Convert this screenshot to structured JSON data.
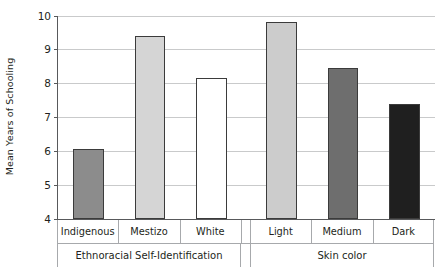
{
  "chart_data": {
    "type": "bar",
    "title": "",
    "subtitle": "",
    "xlabel": "",
    "ylabel": "Mean Years of Schooling",
    "ylim": [
      4,
      10
    ],
    "ytick_labels": [
      "10",
      "9",
      "8",
      "7",
      "6",
      "5",
      "4"
    ],
    "ytick_values": [
      10,
      9,
      8,
      7,
      6,
      5,
      4
    ],
    "grid": true,
    "legend": "none",
    "categories": [
      "Indigenous",
      "Mestizo",
      "White",
      "Light",
      "Medium",
      "Dark"
    ],
    "values": [
      6.05,
      9.4,
      8.15,
      9.8,
      8.45,
      7.4
    ],
    "bar_colors": [
      "#8c8c8c",
      "#d5d5d5",
      "#ffffff",
      "#cccccc",
      "#6e6e6e",
      "#1f1f1f"
    ],
    "bar_border_color": "#3b3b3b",
    "groups": [
      {
        "label": "Ethnoracial Self-Identification",
        "categories": [
          "Indigenous",
          "Mestizo",
          "White"
        ]
      },
      {
        "label": "Skin color",
        "categories": [
          "Light",
          "Medium",
          "Dark"
        ]
      }
    ],
    "series": [
      {
        "name": "Mean Years of Schooling",
        "points": [
          {
            "category": "Indigenous",
            "group": "Ethnoracial Self-Identification",
            "value": 6.05,
            "color": "#8c8c8c"
          },
          {
            "category": "Mestizo",
            "group": "Ethnoracial Self-Identification",
            "value": 9.4,
            "color": "#d5d5d5"
          },
          {
            "category": "White",
            "group": "Ethnoracial Self-Identification",
            "value": 8.15,
            "color": "#ffffff"
          },
          {
            "category": "Light",
            "group": "Skin color",
            "value": 9.8,
            "color": "#cccccc"
          },
          {
            "category": "Medium",
            "group": "Skin color",
            "value": 8.45,
            "color": "#6e6e6e"
          },
          {
            "category": "Dark",
            "group": "Skin color",
            "value": 7.4,
            "color": "#1f1f1f"
          }
        ]
      }
    ],
    "axis_color": "#58595b",
    "grid_color": "#c9cacb"
  }
}
